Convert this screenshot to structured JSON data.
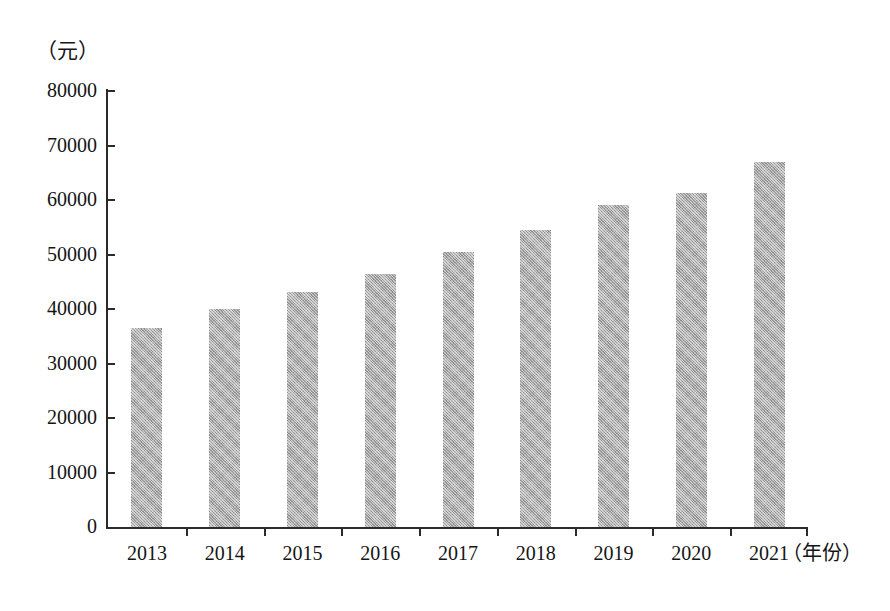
{
  "chart_data": {
    "type": "bar",
    "title": "",
    "subtitle": "",
    "xlabel": "（年份）",
    "ylabel": "（元）",
    "categories": [
      "2013",
      "2014",
      "2015",
      "2016",
      "2017",
      "2018",
      "2019",
      "2020",
      "2021"
    ],
    "values": [
      36600,
      40000,
      43100,
      46500,
      50400,
      54500,
      59000,
      61300,
      67000
    ],
    "series": [
      {
        "name": "",
        "values": [
          36600,
          40000,
          43100,
          46500,
          50400,
          54500,
          59000,
          61300,
          67000
        ]
      }
    ],
    "ylim": [
      0,
      80000
    ],
    "y_ticks": [
      "0",
      "10000",
      "20000",
      "30000",
      "40000",
      "50000",
      "60000",
      "70000",
      "80000"
    ],
    "y_tick_values": [
      0,
      10000,
      20000,
      30000,
      40000,
      50000,
      60000,
      70000,
      80000
    ],
    "grid": false,
    "legend": "none",
    "bar_color": "#a9a9a9",
    "axis_color": "#2b2b2b"
  },
  "axes": {
    "y_unit": "（元）",
    "x_unit": "（年份）"
  }
}
